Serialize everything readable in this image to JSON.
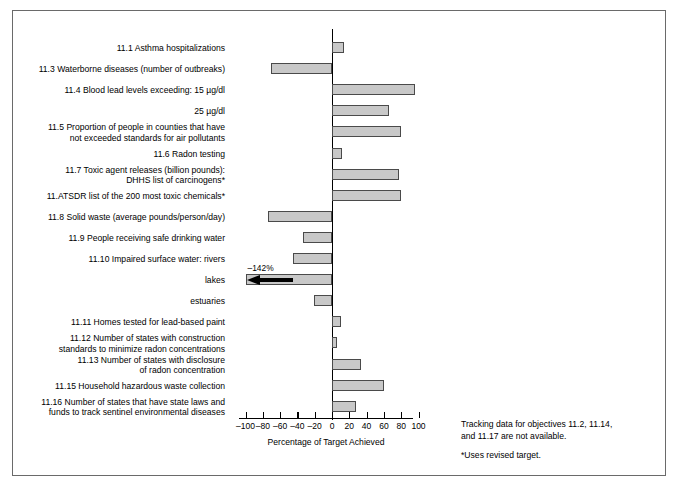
{
  "chart_data": {
    "type": "bar",
    "orientation": "horizontal",
    "title": "",
    "xlabel": "Percentage of Target Achieved",
    "ylabel": "",
    "xlim": [
      -100,
      100
    ],
    "xticks": [
      -100,
      -80,
      -60,
      -40,
      -20,
      0,
      20,
      40,
      60,
      80,
      100
    ],
    "xticklabels": [
      "–100",
      "–80",
      "–60",
      "–40",
      "–20",
      "0",
      "20",
      "40",
      "60",
      "80",
      "100"
    ],
    "grid": false,
    "legend": null,
    "categories": [
      "11.1 Asthma hospitalizations",
      "11.3 Waterborne diseases (number of outbreaks)",
      "11.4 Blood lead levels exceeding:  15 µg/dl",
      "25 µg/dl",
      "11.5 Proportion of people in counties that have\nnot exceeded standards for air pollutants",
      "11.6 Radon testing",
      "11.7 Toxic agent releases (billion pounds):\nDHHS list of carcinogens*",
      "11.ATSDR list of the 200 most toxic chemicals*",
      "11.8 Solid waste (average pounds/person/day)",
      "11.9 People receiving safe drinking water",
      "11.10 Impaired surface water: rivers",
      "lakes",
      "estuaries",
      "11.11 Homes tested for lead-based paint",
      "11.12 Number of states with construction\nstandards to minimize radon concentrations",
      "11.13 Number of states with disclosure\nof radon concentration",
      "11.15 Household hazardous waste collection",
      "11.16 Number of states that have state laws and\nfunds to track sentinel environmental diseases"
    ],
    "values": [
      14,
      -70,
      96,
      66,
      80,
      12,
      78,
      80,
      -74,
      -34,
      -45,
      -142,
      -21,
      10,
      6,
      34,
      60,
      28
    ],
    "offscale": [
      {
        "index": 11,
        "label": "–142%",
        "clipped_at": -100,
        "marker": "arrow-left"
      }
    ],
    "annotations": [
      "Tracking data for objectives 11.2, 11.14,",
      "and 11.17 are not available."
    ],
    "footnote": "*Uses revised target.",
    "colors": {
      "bar_fill": "#c8c8c8",
      "bar_stroke": "#4a4a4a",
      "axis": "#000000",
      "text": "#000000",
      "background": "#ffffff",
      "frame": "#6a6a6a"
    }
  },
  "notes": {
    "line1": "Tracking data for objectives 11.2, 11.14,",
    "line2": "and 11.17 are not available.",
    "footnote": "*Uses revised target."
  },
  "axis": {
    "xlabel": "Percentage of Target Achieved"
  }
}
